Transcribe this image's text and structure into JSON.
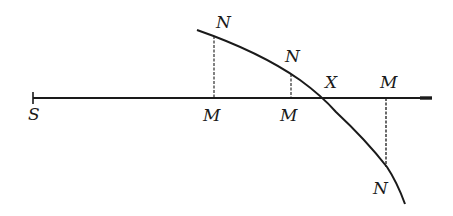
{
  "diagram": {
    "type": "geometry",
    "colors": {
      "ink": "#1a1a1a",
      "background": "#ffffff"
    },
    "axis": {
      "from": [
        33,
        98
      ],
      "to": [
        432,
        98
      ]
    },
    "curve": {
      "start": [
        197,
        30
      ],
      "through": [
        [
          214,
          35
        ],
        [
          291,
          73
        ],
        [
          322,
          98
        ],
        [
          387,
          167
        ]
      ],
      "end": [
        405,
        204
      ]
    },
    "perpendiculars": [
      {
        "x": 214,
        "top": 36,
        "bottom": 98,
        "style": "dashed"
      },
      {
        "x": 291,
        "top": 74,
        "bottom": 98,
        "style": "dashed"
      },
      {
        "x": 386,
        "top": 98,
        "bottom": 167,
        "style": "dashed"
      }
    ],
    "labels": {
      "s": "S",
      "n1": "N",
      "m1": "M",
      "n2": "N",
      "m2": "M",
      "x": "X",
      "m3": "M",
      "n3": "N"
    }
  }
}
